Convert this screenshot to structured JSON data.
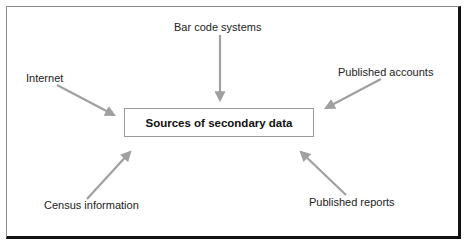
{
  "diagram": {
    "type": "hub-and-spoke",
    "center": {
      "label": "Sources of secondary data"
    },
    "sources": [
      {
        "id": "barcode",
        "label": "Bar code systems",
        "position": "top"
      },
      {
        "id": "internet",
        "label": "Internet",
        "position": "top-left"
      },
      {
        "id": "accounts",
        "label": "Published accounts",
        "position": "top-right"
      },
      {
        "id": "census",
        "label": "Census information",
        "position": "bottom-left"
      },
      {
        "id": "reports",
        "label": "Published reports",
        "position": "bottom-right"
      }
    ],
    "arrow_color": "#a0a0a0",
    "frame_color": "#111111"
  }
}
